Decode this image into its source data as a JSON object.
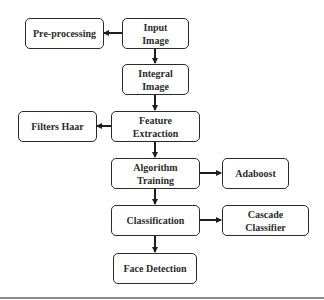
{
  "diagram": {
    "type": "flowchart",
    "nodes": [
      {
        "id": "input",
        "label": "Input\nImage",
        "line1": "Input",
        "line2": "Image"
      },
      {
        "id": "pre",
        "label": "Pre-processing"
      },
      {
        "id": "integral",
        "label": "Integral\nImage",
        "line1": "Integral",
        "line2": "Image"
      },
      {
        "id": "feature",
        "label": "Feature\nExtraction",
        "line1": "Feature",
        "line2": "Extraction"
      },
      {
        "id": "haar",
        "label": "Filters Haar"
      },
      {
        "id": "training",
        "label": "Algorithm\nTraining",
        "line1": "Algorithm",
        "line2": "Training"
      },
      {
        "id": "adaboost",
        "label": "Adaboost"
      },
      {
        "id": "classification",
        "label": "Classification"
      },
      {
        "id": "cascade",
        "label": "Cascade\nClassifier",
        "line1": "Cascade",
        "line2": "Classifier"
      },
      {
        "id": "face",
        "label": "Face Detection"
      }
    ],
    "edges": [
      {
        "from": "input",
        "to": "pre"
      },
      {
        "from": "input",
        "to": "integral"
      },
      {
        "from": "integral",
        "to": "feature"
      },
      {
        "from": "feature",
        "to": "haar"
      },
      {
        "from": "feature",
        "to": "training"
      },
      {
        "from": "training",
        "to": "adaboost"
      },
      {
        "from": "training",
        "to": "classification"
      },
      {
        "from": "classification",
        "to": "cascade"
      },
      {
        "from": "classification",
        "to": "face"
      }
    ]
  }
}
